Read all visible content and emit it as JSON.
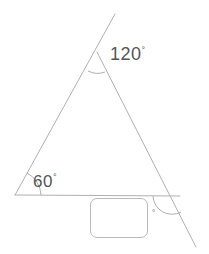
{
  "figure": {
    "type": "geometry-diagram",
    "stroke_color": "#b0b0b0",
    "text_color": "#555555",
    "background_color": "#ffffff",
    "labels": {
      "apex_angle": "120",
      "apex_degree_symbol": "°",
      "base_left_angle": "60",
      "base_left_degree_symbol": "°",
      "unknown_degree_symbol": "°"
    },
    "input": {
      "value": "",
      "placeholder": ""
    },
    "geometry": {
      "apex_vertex": [
        97,
        52
      ],
      "base_left_vertex": [
        15,
        195
      ],
      "base_right_vertex": [
        172,
        196
      ],
      "left_side_extension_top": [
        115,
        14
      ],
      "right_side_extension_bottom": [
        196,
        247
      ],
      "base_extension_right": [
        180,
        196
      ]
    }
  }
}
